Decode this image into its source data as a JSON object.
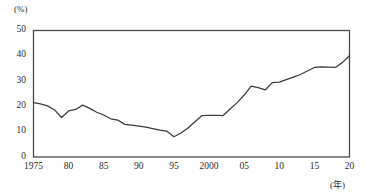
{
  "chart_data": {
    "type": "line",
    "title": "",
    "subtitle": "",
    "xlabel": "(年)",
    "ylabel": "(%)",
    "xlim": [
      1975,
      2020
    ],
    "ylim": [
      0,
      50
    ],
    "grid": false,
    "legend": "none",
    "y_ticks": [
      0,
      10,
      20,
      30,
      40,
      50
    ],
    "y_tick_labels": [
      "0",
      "10",
      "20",
      "30",
      "40",
      "50"
    ],
    "x_ticks": [
      1975,
      1980,
      1985,
      1990,
      1995,
      2000,
      2005,
      2010,
      2015,
      2020
    ],
    "x_tick_labels": [
      "1975",
      "80",
      "85",
      "90",
      "95",
      "2000",
      "05",
      "10",
      "15",
      "20"
    ],
    "series": [
      {
        "name": "series-1",
        "color": "#3a3a3a",
        "x": [
          1975,
          1976,
          1977,
          1978,
          1979,
          1980,
          1981,
          1982,
          1983,
          1984,
          1985,
          1986,
          1987,
          1988,
          1989,
          1990,
          1991,
          1992,
          1993,
          1994,
          1995,
          1996,
          1997,
          1998,
          1999,
          2000,
          2001,
          2002,
          2003,
          2004,
          2005,
          2006,
          2007,
          2008,
          2009,
          2010,
          2011,
          2012,
          2013,
          2014,
          2015,
          2016,
          2017,
          2018,
          2019,
          2020
        ],
        "values": [
          21.5,
          21.0,
          20.2,
          18.6,
          15.6,
          18.2,
          18.8,
          20.5,
          19.2,
          17.7,
          16.6,
          15.1,
          14.6,
          12.9,
          12.6,
          12.2,
          11.8,
          11.2,
          10.6,
          10.2,
          8.0,
          9.5,
          11.5,
          13.9,
          16.4,
          16.5,
          16.5,
          16.4,
          19.0,
          21.5,
          24.5,
          28.0,
          27.4,
          26.5,
          29.4,
          29.6,
          30.6,
          31.6,
          32.6,
          34.0,
          35.4,
          35.6,
          35.5,
          35.4,
          37.4,
          40.0
        ]
      }
    ]
  },
  "axis": {
    "y_unit": "(%)",
    "x_unit": "(年)"
  }
}
